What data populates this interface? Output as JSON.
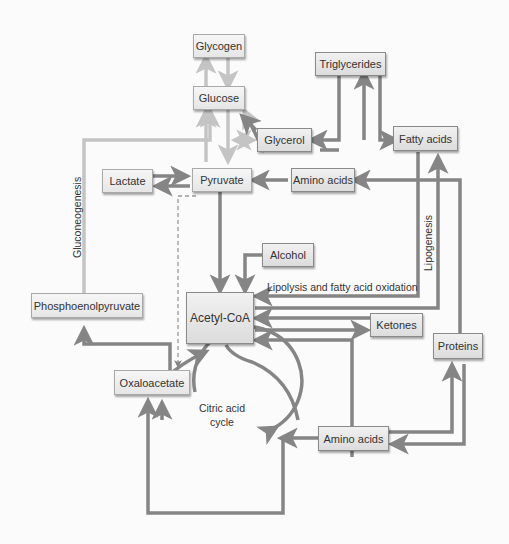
{
  "diagram": {
    "nodes": {
      "glycogen": "Glycogen",
      "glucose": "Glucose",
      "triglycerides": "Triglycerides",
      "glycerol": "Glycerol",
      "fatty_acids": "Fatty acids",
      "lactate": "Lactate",
      "pyruvate": "Pyruvate",
      "amino_acids_top": "Amino acids",
      "alcohol": "Alcohol",
      "acetyl_coa": "Acetyl-CoA",
      "ketones": "Ketones",
      "proteins": "Proteins",
      "phosphoenolpyruvate": "Phosphoenolpyruvate",
      "oxaloacetate": "Oxaloacetate",
      "amino_acids_bottom": "Amino acids"
    },
    "labels": {
      "gluconeogenesis": "Gluconeogenesis",
      "lipogenesis": "Lipogenesis",
      "lipolysis": "Lipolysis and fatty acid oxidation",
      "citric_acid_cycle_line1": "Citric acid",
      "citric_acid_cycle_line2": "cycle"
    },
    "colors": {
      "dark_arrow": "#858585",
      "light_arrow": "#c4c4c4",
      "node_border": "#8a8a8a",
      "node_fill": "#e6e6e6"
    }
  }
}
